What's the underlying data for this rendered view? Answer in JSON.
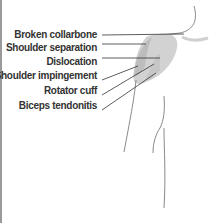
{
  "diagram": {
    "labels": [
      {
        "id": "broken-collarbone",
        "text": "Broken collarbone"
      },
      {
        "id": "shoulder-separation",
        "text": "Shoulder separation"
      },
      {
        "id": "dislocation",
        "text": "Dislocation"
      },
      {
        "id": "shoulder-impingement",
        "text": "Shoulder impingement"
      },
      {
        "id": "rotator-cuff",
        "text": "Rotator cuff"
      },
      {
        "id": "biceps-tendonitis",
        "text": "Biceps tendonitis"
      }
    ],
    "colors": {
      "outline": "#8a8a8a",
      "shoulder_fill": "#cfcfcf",
      "shoulder_fill_dark": "#b5b5b5",
      "leader_line": "#333333",
      "text": "#333333"
    }
  }
}
